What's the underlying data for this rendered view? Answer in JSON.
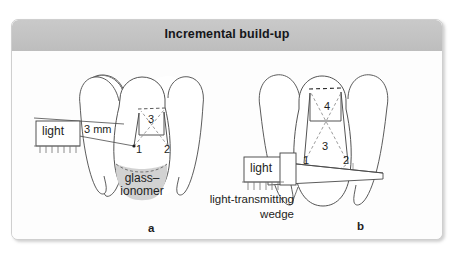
{
  "figure": {
    "title": "Incremental build-up",
    "panels": [
      {
        "id": "a",
        "label": "a",
        "light_label": "light",
        "depth_label": "3 mm",
        "material_label_line1": "glass–",
        "material_label_line2": "ionomer",
        "increments": [
          "1",
          "2",
          "3"
        ]
      },
      {
        "id": "b",
        "label": "b",
        "light_label": "light",
        "wedge_label_line1": "light-transmitting",
        "wedge_label_line2": "wedge",
        "increments": [
          "1",
          "2",
          "3",
          "4"
        ]
      }
    ]
  },
  "colors": {
    "title_band": "#c3c3c3",
    "frame_border": "#cfcfcf",
    "page_background": "#ffffff",
    "panel_background": "#fdfdfd",
    "ink": "#3a3a3a",
    "material_fill": "#d2d2d2",
    "text": "#1d1e22"
  }
}
